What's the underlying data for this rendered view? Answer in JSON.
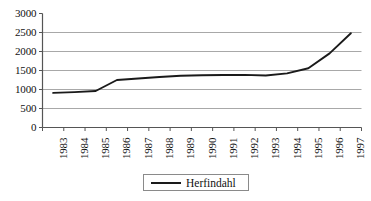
{
  "chart_data": {
    "type": "line",
    "title": "",
    "subtitle": "",
    "xlabel": "",
    "ylabel": "",
    "grid": true,
    "legend_position": "bottom-center",
    "ylim": [
      0,
      3000
    ],
    "ytick_labels": [
      "3000",
      "2500",
      "2000",
      "1500",
      "1000",
      "500",
      "0"
    ],
    "ytick_values": [
      3000,
      2500,
      2000,
      1500,
      1000,
      500,
      0
    ],
    "categories": [
      "1983",
      "1984",
      "1985",
      "1986",
      "1987",
      "1988",
      "1989",
      "1990",
      "1991",
      "1992",
      "1993",
      "1994",
      "1995",
      "1996",
      "1997"
    ],
    "x": [
      1983,
      1984,
      1985,
      1986,
      1987,
      1988,
      1989,
      1990,
      1991,
      1992,
      1993,
      1994,
      1995,
      1996,
      1997
    ],
    "series": [
      {
        "name": "Herfindahl",
        "color": "#1a1a1a",
        "values": [
          910,
          930,
          960,
          1250,
          1290,
          1330,
          1360,
          1375,
          1380,
          1385,
          1370,
          1425,
          1560,
          1950,
          2480
        ]
      }
    ]
  },
  "legend": {
    "entries": [
      {
        "label": "Herfindahl",
        "marker": "line-sample",
        "color": "#1a1a1a"
      }
    ]
  },
  "axes": {
    "y_axis_name": "value-axis",
    "x_axis_name": "year-axis",
    "axis_color": "#555555",
    "grid_color": "#a8a8a8"
  }
}
